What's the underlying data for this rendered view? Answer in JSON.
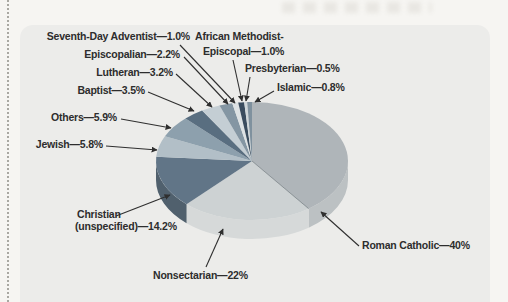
{
  "colors": {
    "page": "#f6f5f2",
    "panel": "#ececea",
    "label_text": "#2d2d2d",
    "arrow": "#2f2f2f"
  },
  "chart_data": {
    "type": "pie",
    "style": "3d",
    "title": "",
    "legend": "none",
    "direction": "clockwise",
    "start_angle_deg": 0,
    "slices": [
      {
        "label": "Roman Catholic",
        "value": 40,
        "display": "Roman Catholic—40%",
        "color": "#afb5b9",
        "side_color": "#bcc1c3"
      },
      {
        "label": "Nonsectarian",
        "value": 22,
        "display": "Nonsectarian—22%",
        "color": "#cdd2d3",
        "side_color": "#d6d9d9"
      },
      {
        "label": "Christian (unspecified)",
        "value": 14.2,
        "display_lines": [
          "Christian",
          "(unspecified)—14.2%"
        ],
        "color": "#617587",
        "side_color": "#50606d"
      },
      {
        "label": "Jewish",
        "value": 5.8,
        "display": "Jewish—5.8%",
        "color": "#b2bfc7"
      },
      {
        "label": "Others",
        "value": 5.9,
        "display": "Others—5.9%",
        "color": "#8da0ad"
      },
      {
        "label": "Baptist",
        "value": 3.5,
        "display": "Baptist—3.5%",
        "color": "#596e80"
      },
      {
        "label": "Lutheran",
        "value": 3.2,
        "display": "Lutheran—3.2%",
        "color": "#c4ced4"
      },
      {
        "label": "Episcopalian",
        "value": 2.2,
        "display": "Episcopalian—2.2%",
        "color": "#8496a3"
      },
      {
        "label": "Seventh-Day Adventist",
        "value": 1.0,
        "display": "Seventh-Day Adventist—1.0%",
        "color": "#dde2e4"
      },
      {
        "label": "African Methodist-Episcopal",
        "value": 1.0,
        "display_lines": [
          "African Methodist-",
          "Episcopal—1.0%"
        ],
        "color": "#3a4c5e"
      },
      {
        "label": "Presbyterian",
        "value": 0.5,
        "display": "Presbyterian—0.5%",
        "color": "#d0d7da"
      },
      {
        "label": "Islamic",
        "value": 0.8,
        "display": "Islamic—0.8%",
        "color": "#7f919e"
      }
    ]
  }
}
